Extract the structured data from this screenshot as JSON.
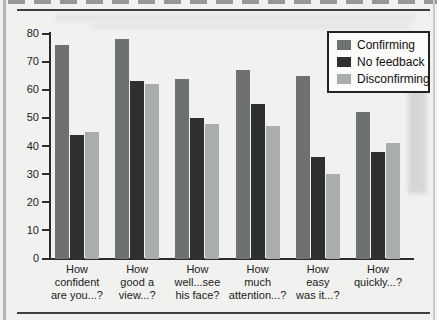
{
  "page": {
    "background_color": "#f1f1ef",
    "left_edge_color": "#b4b4b4",
    "rule_color": "#3f3f3f"
  },
  "chart_data": {
    "type": "bar",
    "title": "",
    "xlabel": "",
    "ylabel": "",
    "categories": [
      "How confident are you...?",
      "How good a view...?",
      "How well...see his face?",
      "How much attention...?",
      "How easy was it...?",
      "How quickly...?"
    ],
    "category_lines": [
      [
        "How",
        "confident",
        "are you...?"
      ],
      [
        "How",
        "good a",
        "view...?"
      ],
      [
        "How",
        "well...see",
        "his face?"
      ],
      [
        "How",
        "much",
        "attention...?"
      ],
      [
        "How",
        "easy",
        "was it...?"
      ],
      [
        "How",
        "quickly...?"
      ]
    ],
    "series": [
      {
        "name": "Confirming",
        "color": "#6d7171",
        "values": [
          76,
          78,
          64,
          67,
          65,
          52
        ]
      },
      {
        "name": "No feedback",
        "color": "#2e3030",
        "values": [
          44,
          63,
          50,
          55,
          36,
          38
        ]
      },
      {
        "name": "Disconfirming",
        "color": "#a9adad",
        "values": [
          45,
          62,
          48,
          47,
          30,
          41
        ]
      }
    ],
    "ylim": [
      0,
      80
    ],
    "yticks": [
      0,
      10,
      20,
      30,
      40,
      50,
      60,
      70,
      80
    ],
    "grid": false,
    "legend_position": "top-right"
  }
}
